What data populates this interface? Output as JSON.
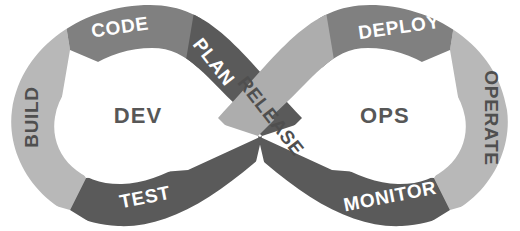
{
  "diagram": {
    "type": "devops-infinity-loop",
    "title": "DevOps Infinity Loop",
    "hubs": [
      {
        "id": "dev",
        "label": "DEV",
        "cx": 138,
        "cy": 115
      },
      {
        "id": "ops",
        "label": "OPS",
        "cx": 385,
        "cy": 115
      }
    ],
    "stages": [
      {
        "id": "plan",
        "label": "PLAN",
        "loop": "dev",
        "fill": "#5a5a5a",
        "text_tone": "on-dark",
        "tx": 214,
        "ty": 62,
        "rotate": 52,
        "font_size": 19
      },
      {
        "id": "code",
        "label": "CODE",
        "loop": "dev",
        "fill": "#808080",
        "text_tone": "on-dark",
        "tx": 120,
        "ty": 27,
        "rotate": -8,
        "font_size": 19
      },
      {
        "id": "build",
        "label": "BUILD",
        "loop": "dev",
        "fill": "#b8b8b8",
        "text_tone": "on-light",
        "tx": 31,
        "ty": 117,
        "rotate": -90,
        "font_size": 19
      },
      {
        "id": "test",
        "label": "TEST",
        "loop": "dev",
        "fill": "#5a5a5a",
        "text_tone": "on-dark",
        "tx": 145,
        "ty": 197,
        "rotate": -11,
        "font_size": 19
      },
      {
        "id": "release",
        "label": "RELEASE",
        "loop": "ops",
        "fill": "#adadad",
        "text_tone": "on-light",
        "tx": 271,
        "ty": 116,
        "rotate": 52,
        "font_size": 18
      },
      {
        "id": "deploy",
        "label": "DEPLOY",
        "loop": "ops",
        "fill": "#808080",
        "text_tone": "on-dark",
        "tx": 399,
        "ty": 27,
        "rotate": -8,
        "font_size": 19
      },
      {
        "id": "operate",
        "label": "OPERATE",
        "loop": "ops",
        "fill": "#b8b8b8",
        "text_tone": "on-light",
        "tx": 491,
        "ty": 118,
        "rotate": 90,
        "font_size": 18
      },
      {
        "id": "monitor",
        "label": "MONITOR",
        "loop": "ops",
        "fill": "#5a5a5a",
        "text_tone": "on-dark",
        "tx": 390,
        "ty": 196,
        "rotate": -11,
        "font_size": 19
      }
    ],
    "colors": {
      "lightest": "#b8b8b8",
      "light": "#adadad",
      "medium": "#808080",
      "dark": "#5a5a5a",
      "hub_fill": "#ffffff",
      "hub_text": "#575757",
      "label_on_dark": "#ffffff",
      "label_on_light": "#4f4f4f",
      "background": "#ffffff"
    }
  }
}
